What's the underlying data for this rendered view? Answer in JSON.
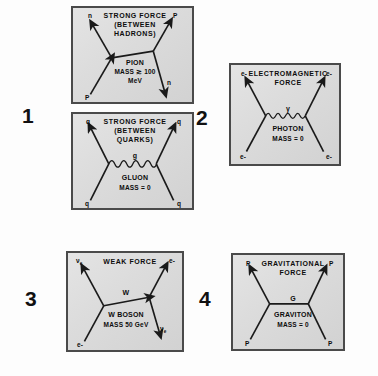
{
  "figure": {
    "background_color": "#fdfdfd",
    "panel_fill": "#dcdcdc",
    "panel_border_color": "#4a4a4a",
    "line_color": "#1a1a1a"
  },
  "groups": [
    {
      "numeral": "1"
    },
    {
      "numeral": "2"
    },
    {
      "numeral": "3"
    },
    {
      "numeral": "4"
    }
  ],
  "panels": {
    "strong_hadrons": {
      "title_line1": "STRONG FORCE",
      "title_line2": "(BETWEEN",
      "title_line3": "HADRONS)",
      "mediator": "PION",
      "mass_line": "MASS ≳ 100",
      "mass_unit": "MeV",
      "in_left": "P",
      "in_right": "n",
      "out_left": "n",
      "out_right": "P",
      "propagator_style": "straight"
    },
    "strong_quarks": {
      "title_line1": "STRONG FORCE",
      "title_line2": "(BETWEEN",
      "title_line3": "QUARKS)",
      "propagator_symbol": "g",
      "mediator": "GLUON",
      "mass_line": "MASS = 0",
      "in_left": "q",
      "in_right": "q",
      "out_left": "q",
      "out_right": "q",
      "propagator_style": "coil"
    },
    "electromagnetic": {
      "title_line1": "ELECTROMAGNETIC",
      "title_line2": "FORCE",
      "propagator_symbol": "γ",
      "mediator": "PHOTON",
      "mass_line": "MASS = 0",
      "in_left": "e-",
      "in_right": "e-",
      "out_left": "e-",
      "out_right": "e-",
      "propagator_style": "wavy"
    },
    "weak": {
      "title_line1": "WEAK FORCE",
      "propagator_symbol": "W",
      "mediator": "W BOSON",
      "mass_line": "MASS   50 GeV",
      "in_left": "e-",
      "in_right": "ν",
      "in_right_sub": "e",
      "out_left": "ν",
      "out_left_sub": "e",
      "out_right": "e-",
      "propagator_style": "straight-slanted"
    },
    "gravitational": {
      "title_line1": "GRAVITATIONAL",
      "title_line2": "FORCE",
      "propagator_symbol": "G",
      "mediator": "GRAVITON",
      "mass_line": "MASS = 0",
      "in_left": "P",
      "in_right": "P",
      "out_left": "P",
      "out_right": "P",
      "propagator_style": "straight"
    }
  }
}
